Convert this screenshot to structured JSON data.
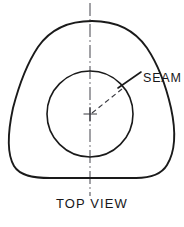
{
  "drawing": {
    "title": "Top View",
    "view_label": "TOP VIEW",
    "annotations": [
      {
        "name": "seam",
        "label": "SEAM",
        "leader_from_x": 118,
        "leader_from_y": 88,
        "leader_to_x": 140,
        "leader_to_y": 73
      }
    ],
    "colors": {
      "outline": "#1a1a1a",
      "centerline": "#55555c",
      "background": "#ffffff",
      "text": "#17171a"
    },
    "geometry": {
      "canvas_width": 184,
      "canvas_height": 227,
      "outer_shape": "rounded-triangle",
      "outer_apex_x": 92,
      "outer_apex_y": 21,
      "outer_left_x": 10,
      "outer_right_x": 172,
      "outer_bottom_y": 178,
      "inner_circle_cx": 90,
      "inner_circle_cy": 114,
      "inner_circle_r": 43,
      "centerline_x": 90,
      "centerline_top_y": 3,
      "centerline_bottom_y": 196,
      "center_mark_size": 7,
      "radius_angle_deg": 40
    },
    "paths": {
      "outer_outline": "M 92 21 C 118 21 136 32 147 48 C 157 63 166 86 171 108 C 176 131 175 152 167 165 C 161 175 150 178 136 178 L 50 178 C 34 178 20 176 14 166 C 7 154 8 131 13 108 C 19 85 28 62 38 47 C 49 31 66 21 92 21 Z",
      "center_mark": "M 83.5 114 L 97 114 M 90 107 L 90 121.5",
      "radius_dashed": "M 92 113 L 122 89",
      "leader_line": "M 118 88 L 141 72"
    }
  }
}
